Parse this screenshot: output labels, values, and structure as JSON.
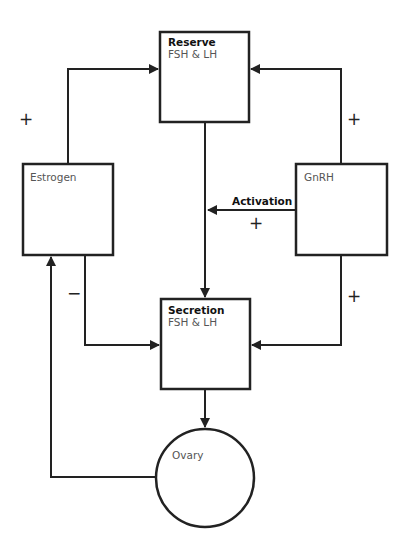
{
  "nodes": {
    "reserve": {
      "title": "Reserve",
      "subtitle": "FSH & LH"
    },
    "secretion": {
      "title": "Secretion",
      "subtitle": "FSH & LH"
    },
    "estrogen": {
      "label": "Estrogen"
    },
    "gnrh": {
      "label": "GnRH"
    },
    "ovary": {
      "label": "Ovary"
    }
  },
  "edges": {
    "estrogen_to_reserve": {
      "sign": "+"
    },
    "gnrh_to_reserve": {
      "sign": "+"
    },
    "gnrh_activation": {
      "label": "Activation",
      "sign": "+"
    },
    "estrogen_to_secretion": {
      "sign": "−"
    },
    "gnrh_to_secretion": {
      "sign": "+"
    }
  },
  "colors": {
    "stroke": "#222222",
    "text": "#555555"
  }
}
